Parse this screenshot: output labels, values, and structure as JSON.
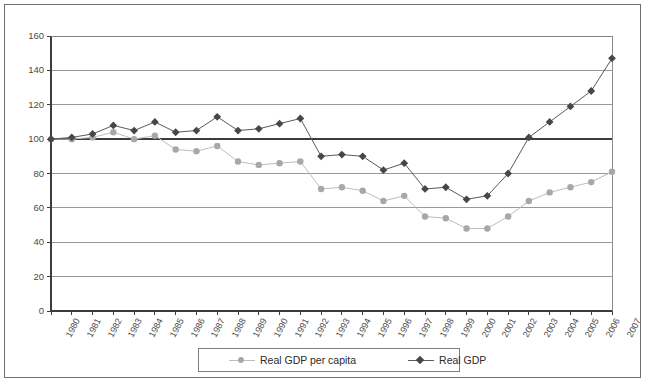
{
  "chart_data": {
    "type": "line",
    "title": "",
    "subtitle": "",
    "xlabel": "",
    "ylabel": "",
    "xlim": [
      1980,
      2007
    ],
    "ylim": [
      0,
      160
    ],
    "ytick_step": 20,
    "grid": true,
    "grid_axis": "y",
    "legend_position": "bottom-center",
    "categories": [
      "1980",
      "1981",
      "1982",
      "1983",
      "1984",
      "1985",
      "1986",
      "1987",
      "1988",
      "1989",
      "1990",
      "1991",
      "1992",
      "1993",
      "1994",
      "1995",
      "1996",
      "1997",
      "1998",
      "1999",
      "2000",
      "2001",
      "2002",
      "2003",
      "2004",
      "2005",
      "2006",
      "2007"
    ],
    "yticks": [
      0,
      20,
      40,
      60,
      80,
      100,
      120,
      140,
      160
    ],
    "series": [
      {
        "name": "Real GDP per capita",
        "marker": "circle",
        "color": "#a8a8a8",
        "line_color": "#bdbdbd",
        "values": [
          100,
          100,
          101,
          104,
          100,
          102,
          94,
          93,
          96,
          87,
          85,
          86,
          87,
          71,
          72,
          70,
          64,
          67,
          55,
          54,
          48,
          48,
          55,
          64,
          69,
          72,
          75,
          81
        ]
      },
      {
        "name": "Real GDP",
        "marker": "diamond",
        "color": "#474747",
        "line_color": "#5a5a5a",
        "values": [
          100,
          101,
          103,
          108,
          105,
          110,
          104,
          105,
          113,
          105,
          106,
          109,
          112,
          90,
          91,
          90,
          82,
          86,
          71,
          72,
          65,
          67,
          80,
          101,
          110,
          119,
          128,
          147
        ]
      }
    ]
  },
  "legend": {
    "items": [
      {
        "label": "Real GDP per capita"
      },
      {
        "label": "Real GDP"
      }
    ]
  },
  "colors": {
    "frame": "#6e6e6e",
    "axis": "#3c3c3c",
    "grid": "#808080",
    "series_light": "#a8a8a8",
    "series_dark": "#474747",
    "background": "#ffffff"
  }
}
